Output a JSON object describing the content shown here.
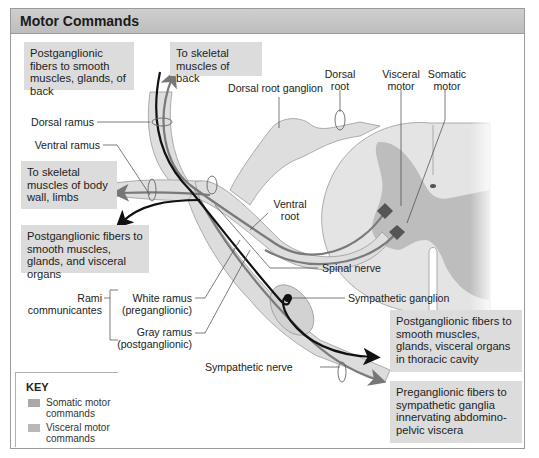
{
  "header": {
    "title": "Motor Commands"
  },
  "boxes": {
    "postgang_back": "Postganglionic fibers to smooth muscles, glands, of back",
    "skeletal_back": "To skeletal muscles of back",
    "skeletal_body": "To skeletal muscles of body wall, limbs",
    "postgang_visceral": "Postganglionic fibers to smooth muscles, glands, and visceral organs",
    "postgang_thoracic": "Postganglionic fibers to smooth muscles, glands, visceral organs in thoracic cavity",
    "pregang_abdominal": "Preganglionic fibers to sympathetic ganglia innervating abdomino-pelvic viscera"
  },
  "labels": {
    "dorsal_ramus": "Dorsal ramus",
    "ventral_ramus": "Ventral ramus",
    "dorsal_root_ganglion": "Dorsal root ganglion",
    "dorsal_root_1": "Dorsal",
    "dorsal_root_2": "root",
    "visceral_motor_1": "Visceral",
    "visceral_motor_2": "motor",
    "somatic_motor_1": "Somatic",
    "somatic_motor_2": "motor",
    "ventral_root_1": "Ventral",
    "ventral_root_2": "root",
    "spinal_nerve": "Spinal nerve",
    "sympathetic_ganglion": "Sympathetic ganglion",
    "white_ramus_1": "White ramus",
    "white_ramus_2": "(preganglionic)",
    "gray_ramus_1": "Gray ramus",
    "gray_ramus_2": "(postganglionic)",
    "rami_1": "Rami",
    "rami_2": "communicantes",
    "sympathetic_nerve": "Sympathetic nerve"
  },
  "key": {
    "title": "KEY",
    "items": [
      {
        "label_1": "Somatic motor",
        "label_2": "commands",
        "color": "#a9a9a9"
      },
      {
        "label_1": "Visceral motor",
        "label_2": "commands",
        "color": "#b8b8b8"
      }
    ]
  },
  "colors": {
    "header_bg": "#c4c4c4",
    "box_bg": "#dcdcdc",
    "nerve_sheath": "#dedede",
    "cord_white": "#e6e6e6",
    "cord_gray": "#bdbdbd",
    "somatic_fiber": "#7a7a7a",
    "visceral_fiber": "#111111"
  }
}
